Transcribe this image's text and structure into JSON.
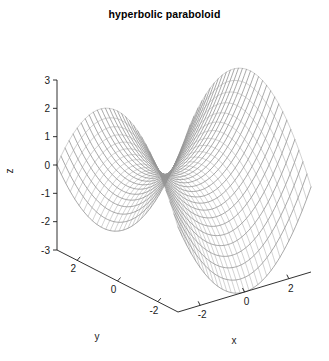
{
  "plot": {
    "title": "hyperbolic paraboloid",
    "background_color": "#ffffff",
    "mesh_color": "#7a7a7a",
    "axis_color": "#1a1a1a"
  },
  "axes": {
    "z": {
      "label": "z",
      "ticks": [
        "3",
        "2",
        "1",
        "0",
        "-1",
        "-2",
        "-3"
      ],
      "range": [
        -3,
        3
      ]
    },
    "y": {
      "label": "y",
      "ticks": [
        "2",
        "0",
        "-2"
      ],
      "range": [
        -3,
        3
      ]
    },
    "x": {
      "label": "x",
      "ticks": [
        "-2",
        "0",
        "2"
      ],
      "range": [
        -3,
        3
      ]
    }
  },
  "chart_data": {
    "type": "line",
    "title": "hyperbolic paraboloid",
    "xlabel": "x",
    "ylabel": "y",
    "zlabel": "z",
    "surface_equation": "z = (x^2 - y^2) / 3",
    "xlim": [
      -3,
      3
    ],
    "ylim": [
      -3,
      3
    ],
    "zlim": [
      -3,
      3
    ],
    "grid": false,
    "legend": "none",
    "xticks": [
      -2,
      0,
      2
    ],
    "yticks": [
      2,
      0,
      -2
    ],
    "zticks": [
      3,
      2,
      1,
      0,
      -1,
      -2,
      -3
    ],
    "mesh_lines": 31,
    "x_samples": [
      -3,
      -2.8,
      -2.6,
      -2.4,
      -2.2,
      -2,
      -1.8,
      -1.6,
      -1.4,
      -1.2,
      -1,
      -0.8,
      -0.6,
      -0.4,
      -0.2,
      0,
      0.2,
      0.4,
      0.6,
      0.8,
      1,
      1.2,
      1.4,
      1.6,
      1.8,
      2,
      2.2,
      2.4,
      2.6,
      2.8,
      3
    ],
    "y_samples": [
      -3,
      -2.8,
      -2.6,
      -2.4,
      -2.2,
      -2,
      -1.8,
      -1.6,
      -1.4,
      -1.2,
      -1,
      -0.8,
      -0.6,
      -0.4,
      -0.2,
      0,
      0.2,
      0.4,
      0.6,
      0.8,
      1,
      1.2,
      1.4,
      1.6,
      1.8,
      2,
      2.2,
      2.4,
      2.6,
      2.8,
      3
    ],
    "view": {
      "azimuth": -37.5,
      "elevation": 30
    },
    "corner_values": {
      "x-3_y-3": 0,
      "x3_y-3": 0,
      "x-3_y3": 0,
      "x3_y3": 0,
      "x0_y0": 0,
      "x3_y0": 3,
      "x-3_y0": 3,
      "x0_y3": -3,
      "x0_y-3": -3
    }
  }
}
